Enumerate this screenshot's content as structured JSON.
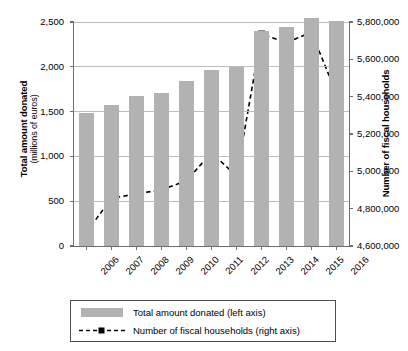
{
  "chart_data": {
    "type": "bar",
    "title": "",
    "subtitle": "",
    "xlabel": "",
    "categories": [
      "2006",
      "2007",
      "2008",
      "2009",
      "2010",
      "2011",
      "2012",
      "2013",
      "2014",
      "2015",
      "2016"
    ],
    "grid": true,
    "legend_position": "bottom",
    "axes": {
      "left": {
        "label": "Total amount donated",
        "label_sub": "(millions of euros)",
        "ticks": [
          "0",
          "500",
          "1,000",
          "1,500",
          "2,000",
          "2,500"
        ],
        "tick_values": [
          0,
          500,
          1000,
          1500,
          2000,
          2500
        ],
        "ylim": [
          0,
          2500
        ]
      },
      "right": {
        "label": "Number of fiscal households",
        "ticks": [
          "4,600,000",
          "4,800,000",
          "5,000,000",
          "5,200,000",
          "5,400,000",
          "5,600,000",
          "5,800,000"
        ],
        "tick_values": [
          4600000,
          4800000,
          5000000,
          5200000,
          5400000,
          5600000,
          5800000
        ],
        "ylim": [
          4600000,
          5800000
        ]
      }
    },
    "series": [
      {
        "name": "Total amount donated (left axis)",
        "legend_label": "Total amount donated (left axis)",
        "type": "bar",
        "axis": "left",
        "color": "#b2b2b2",
        "values": [
          1480,
          1570,
          1670,
          1710,
          1845,
          1960,
          2000,
          2400,
          2440,
          2550,
          2515
        ]
      },
      {
        "name": "Number of fiscal households (right axis)",
        "legend_label": "Number of fiscal households (right axis)",
        "type": "line",
        "axis": "right",
        "color": "#000000",
        "line_style": "dashed",
        "marker": "square",
        "values": [
          4675000,
          4855000,
          4880000,
          4900000,
          4950000,
          5100000,
          4975000,
          5735000,
          5690000,
          5745000,
          5415000
        ]
      }
    ]
  },
  "legend": {
    "items": [
      {
        "label": "Total amount donated (left axis)",
        "key": "swatch"
      },
      {
        "label": "Number of fiscal households (right axis)",
        "key": "dashed-line-square-marker"
      }
    ]
  }
}
